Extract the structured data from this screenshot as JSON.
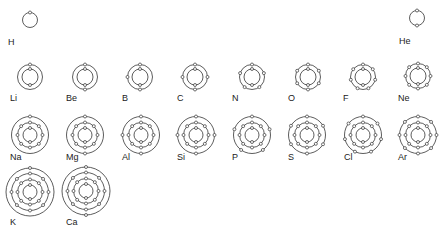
{
  "style": {
    "line_color": "#333333",
    "electron_fill": "#ffffff",
    "label_color": "#222222"
  },
  "elements": [
    {
      "symbol": "H",
      "shells": [
        1
      ],
      "cx": 30,
      "cy": 20,
      "label_x": 8,
      "label_y": 45
    },
    {
      "symbol": "He",
      "shells": [
        2
      ],
      "cx": 417,
      "cy": 18,
      "label_x": 399,
      "label_y": 44
    },
    {
      "symbol": "Li",
      "shells": [
        2,
        1
      ],
      "cx": 30,
      "cy": 77,
      "label_x": 10,
      "label_y": 101
    },
    {
      "symbol": "Be",
      "shells": [
        2,
        2
      ],
      "cx": 85,
      "cy": 77,
      "label_x": 66,
      "label_y": 101
    },
    {
      "symbol": "B",
      "shells": [
        2,
        3
      ],
      "cx": 140,
      "cy": 77,
      "label_x": 122,
      "label_y": 101
    },
    {
      "symbol": "C",
      "shells": [
        2,
        4
      ],
      "cx": 195,
      "cy": 77,
      "label_x": 177,
      "label_y": 101
    },
    {
      "symbol": "N",
      "shells": [
        2,
        5
      ],
      "cx": 252,
      "cy": 77,
      "label_x": 232,
      "label_y": 101
    },
    {
      "symbol": "O",
      "shells": [
        2,
        6
      ],
      "cx": 308,
      "cy": 77,
      "label_x": 288,
      "label_y": 101
    },
    {
      "symbol": "F",
      "shells": [
        2,
        7
      ],
      "cx": 363,
      "cy": 77,
      "label_x": 343,
      "label_y": 101
    },
    {
      "symbol": "Ne",
      "shells": [
        2,
        8
      ],
      "cx": 418,
      "cy": 76,
      "label_x": 398,
      "label_y": 101
    },
    {
      "symbol": "Na",
      "shells": [
        2,
        8,
        1
      ],
      "cx": 30,
      "cy": 135,
      "label_x": 10,
      "label_y": 160
    },
    {
      "symbol": "Mg",
      "shells": [
        2,
        8,
        2
      ],
      "cx": 85,
      "cy": 135,
      "label_x": 66,
      "label_y": 160
    },
    {
      "symbol": "Al",
      "shells": [
        2,
        8,
        3
      ],
      "cx": 141,
      "cy": 135,
      "label_x": 122,
      "label_y": 160
    },
    {
      "symbol": "Si",
      "shells": [
        2,
        8,
        4
      ],
      "cx": 196,
      "cy": 135,
      "label_x": 177,
      "label_y": 160
    },
    {
      "symbol": "P",
      "shells": [
        2,
        8,
        5
      ],
      "cx": 252,
      "cy": 135,
      "label_x": 232,
      "label_y": 160
    },
    {
      "symbol": "S",
      "shells": [
        2,
        8,
        6
      ],
      "cx": 307,
      "cy": 135,
      "label_x": 288,
      "label_y": 160
    },
    {
      "symbol": "Cl",
      "shells": [
        2,
        8,
        7
      ],
      "cx": 363,
      "cy": 135,
      "label_x": 344,
      "label_y": 160
    },
    {
      "symbol": "Ar",
      "shells": [
        2,
        8,
        8
      ],
      "cx": 418,
      "cy": 135,
      "label_x": 398,
      "label_y": 160
    },
    {
      "symbol": "K",
      "shells": [
        2,
        8,
        8,
        1
      ],
      "cx": 30,
      "cy": 192,
      "label_x": 10,
      "label_y": 225
    },
    {
      "symbol": "Ca",
      "shells": [
        2,
        8,
        8,
        2
      ],
      "cx": 86,
      "cy": 191,
      "label_x": 66,
      "label_y": 225
    }
  ]
}
